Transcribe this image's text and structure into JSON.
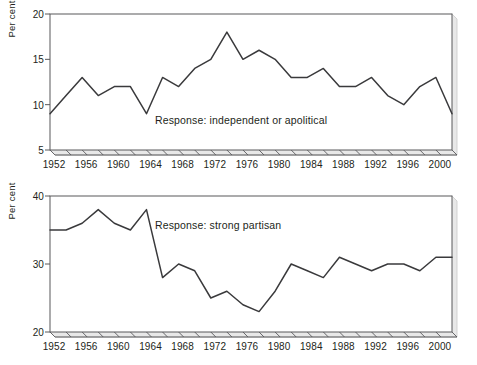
{
  "figure": {
    "width": 477,
    "height": 365,
    "line_color": "#3a3a3c",
    "axis_color": "#58585b",
    "text_color": "#231f20"
  },
  "chart_data": [
    {
      "type": "line",
      "title": "",
      "annotation": "Response: independent or apolitical",
      "xlabel": "",
      "ylabel": "Per cent",
      "xlim": [
        1952,
        2002
      ],
      "ylim": [
        5,
        20
      ],
      "yticks": [
        5,
        10,
        15,
        20
      ],
      "xticks": [
        1952,
        1954,
        1956,
        1958,
        1960,
        1962,
        1964,
        1966,
        1968,
        1970,
        1972,
        1974,
        1976,
        1978,
        1980,
        1982,
        1984,
        1986,
        1988,
        1990,
        1992,
        1994,
        1996,
        1998,
        2000,
        2002
      ],
      "xtick_labels": [
        1952,
        1956,
        1960,
        1964,
        1968,
        1972,
        1976,
        1980,
        1984,
        1988,
        1992,
        1996,
        2000
      ],
      "grid": false,
      "legend": "none",
      "x": [
        1952,
        1954,
        1956,
        1958,
        1960,
        1962,
        1964,
        1966,
        1968,
        1970,
        1972,
        1974,
        1976,
        1978,
        1980,
        1982,
        1984,
        1986,
        1988,
        1990,
        1992,
        1994,
        1996,
        1998,
        2000,
        2002
      ],
      "values": [
        9,
        11,
        13,
        11,
        12,
        12,
        9,
        13,
        12,
        14,
        15,
        18,
        15,
        16,
        15,
        13,
        13,
        14,
        12,
        12,
        13,
        11,
        10,
        12,
        13,
        9
      ]
    },
    {
      "type": "line",
      "title": "",
      "annotation": "Response: strong partisan",
      "xlabel": "",
      "ylabel": "Per cent",
      "xlim": [
        1952,
        2002
      ],
      "ylim": [
        20,
        40
      ],
      "yticks": [
        20,
        30,
        40
      ],
      "xticks": [
        1952,
        1954,
        1956,
        1958,
        1960,
        1962,
        1964,
        1966,
        1968,
        1970,
        1972,
        1974,
        1976,
        1978,
        1980,
        1982,
        1984,
        1986,
        1988,
        1990,
        1992,
        1994,
        1996,
        1998,
        2000,
        2002
      ],
      "xtick_labels": [
        1952,
        1956,
        1960,
        1964,
        1968,
        1972,
        1976,
        1980,
        1984,
        1988,
        1992,
        1996,
        2000
      ],
      "grid": false,
      "legend": "none",
      "x": [
        1952,
        1954,
        1956,
        1958,
        1960,
        1962,
        1964,
        1966,
        1968,
        1970,
        1972,
        1974,
        1976,
        1978,
        1980,
        1982,
        1984,
        1986,
        1988,
        1990,
        1992,
        1994,
        1996,
        1998,
        2000,
        2002
      ],
      "values": [
        35,
        35,
        36,
        38,
        36,
        35,
        38,
        28,
        30,
        29,
        25,
        26,
        24,
        23,
        26,
        30,
        29,
        28,
        31,
        30,
        29,
        30,
        30,
        29,
        31,
        31
      ]
    }
  ]
}
